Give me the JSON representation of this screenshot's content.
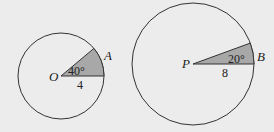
{
  "figures": [
    {
      "center_label": "O",
      "point_label": "A",
      "angle_label": "40°",
      "radius_label": "4"
    },
    {
      "center_label": "P",
      "point_label": "B",
      "angle_label": "20°",
      "radius_label": "8"
    }
  ],
  "colors": {
    "background": "#ececec",
    "sector_fill": "#a8a8a8",
    "stroke": "#333333"
  }
}
